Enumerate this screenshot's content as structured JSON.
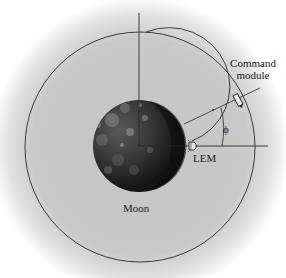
{
  "diagram": {
    "labels": {
      "command_module_line1": "Command",
      "command_module_line2": "module",
      "lem": "LEM",
      "moon": "Moon",
      "angle": "ϕ"
    },
    "colors": {
      "background_glow": "#c8c8c8",
      "line": "#2a2a2a",
      "moon_dark": "#1e1e1e",
      "moon_light": "#6e6e6e"
    }
  }
}
